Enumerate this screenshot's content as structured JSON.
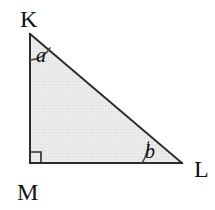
{
  "figure": {
    "background_color": "#ffffff",
    "stroke_color": "#2b2b2b",
    "fill_color": "#e8e8e8",
    "stroke_width": 2,
    "vertices": [
      {
        "name": "K",
        "label": "K",
        "x": 30,
        "y": 34,
        "label_x": 20,
        "label_y": 27
      },
      {
        "name": "M",
        "label": "M",
        "x": 30,
        "y": 163,
        "label_x": 17,
        "label_y": 200
      },
      {
        "name": "L",
        "label": "L",
        "x": 182,
        "y": 163,
        "label_x": 194,
        "label_y": 177
      }
    ],
    "angles": [
      {
        "name": "a",
        "label": "a",
        "at_vertex": "K",
        "label_x": 36,
        "label_y": 62,
        "arc_radius": 26
      },
      {
        "name": "b",
        "label": "b",
        "at_vertex": "L",
        "label_x": 145,
        "label_y": 158,
        "arc_radius": 40
      }
    ],
    "right_angle": {
      "at_vertex": "M",
      "marker": "square",
      "size": 11
    },
    "sides": [
      {
        "name": "KM",
        "from": "K",
        "to": "M"
      },
      {
        "name": "ML",
        "from": "M",
        "to": "L"
      },
      {
        "name": "LK",
        "from": "L",
        "to": "K"
      }
    ]
  }
}
